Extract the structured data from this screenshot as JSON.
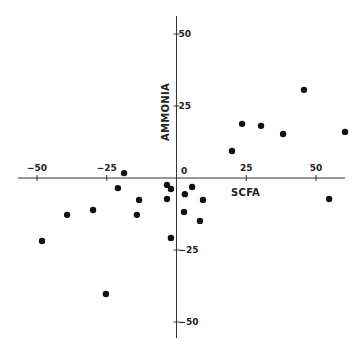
{
  "chart_data": {
    "type": "scatter",
    "title": "",
    "xlabel": "SCFA",
    "ylabel": "AMMONIA",
    "xlim": [
      -57,
      62
    ],
    "ylim": [
      -55,
      57
    ],
    "grid": false,
    "legend": null,
    "x_ticks": [
      -50,
      -25,
      0,
      25,
      50
    ],
    "x_tick_labels": [
      "-50",
      "-25",
      "0",
      "25",
      "50"
    ],
    "y_ticks": [
      50,
      25,
      -25,
      -50
    ],
    "y_tick_labels": [
      "50",
      "25",
      "-25",
      "-50"
    ],
    "axes_style": "cross through origin",
    "marker": {
      "shape": "filled-circle",
      "color": "#111111"
    },
    "points": [
      {
        "x": 45.7,
        "y": 30.6
      },
      {
        "x": 23.5,
        "y": 18.8
      },
      {
        "x": 30.3,
        "y": 18.1
      },
      {
        "x": 38.2,
        "y": 15.3
      },
      {
        "x": 60.4,
        "y": 16.0
      },
      {
        "x": 19.9,
        "y": 9.4
      },
      {
        "x": -18.8,
        "y": 1.7
      },
      {
        "x": -21.0,
        "y": -3.5
      },
      {
        "x": -13.4,
        "y": -7.6
      },
      {
        "x": -14.2,
        "y": -12.8
      },
      {
        "x": -29.9,
        "y": -11.1
      },
      {
        "x": -39.2,
        "y": -12.8
      },
      {
        "x": -48.2,
        "y": -21.9
      },
      {
        "x": -3.4,
        "y": -2.4
      },
      {
        "x": -2.0,
        "y": -3.8
      },
      {
        "x": -3.4,
        "y": -7.3
      },
      {
        "x": -2.0,
        "y": -20.8
      },
      {
        "x": 5.6,
        "y": -3.1
      },
      {
        "x": 3.0,
        "y": -5.6
      },
      {
        "x": 9.5,
        "y": -7.6
      },
      {
        "x": 2.7,
        "y": -11.8
      },
      {
        "x": 8.4,
        "y": -14.9
      },
      {
        "x": -25.3,
        "y": -40.3
      },
      {
        "x": 54.7,
        "y": -7.3
      }
    ]
  },
  "labels": {
    "xlabel": "SCFA",
    "ylabel": "AMMONIA",
    "origin": "0"
  }
}
